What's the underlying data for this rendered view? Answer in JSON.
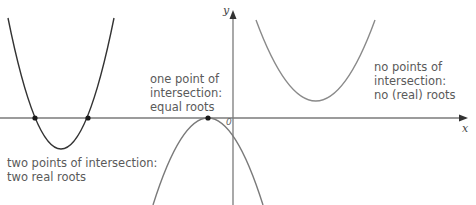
{
  "diagram": {
    "axes": {
      "x_label": "x",
      "y_label": "y",
      "origin_label": "0",
      "x_axis_y": 118,
      "y_axis_x": 233,
      "color": "#7a7a7a"
    },
    "curves": [
      {
        "id": "two-roots",
        "description": "upward parabola crossing x-axis twice",
        "color": "#333333",
        "roots_px": [
          35,
          88
        ],
        "vertex_px": [
          61,
          149
        ],
        "label_lines": [
          "two points of intersection:",
          "two real roots"
        ]
      },
      {
        "id": "equal-roots",
        "description": "downward parabola touching x-axis once",
        "color": "#7a7a7a",
        "touch_point_px": [
          208,
          118
        ],
        "label_lines": [
          "one point of",
          "intersection:",
          "equal roots"
        ]
      },
      {
        "id": "no-roots",
        "description": "upward parabola entirely above x-axis",
        "color": "#8a8a8a",
        "vertex_px": [
          317,
          101
        ],
        "label_lines": [
          "no points of",
          "intersection:",
          "no (real) roots"
        ]
      }
    ],
    "point_color": "#1a1a1a"
  }
}
